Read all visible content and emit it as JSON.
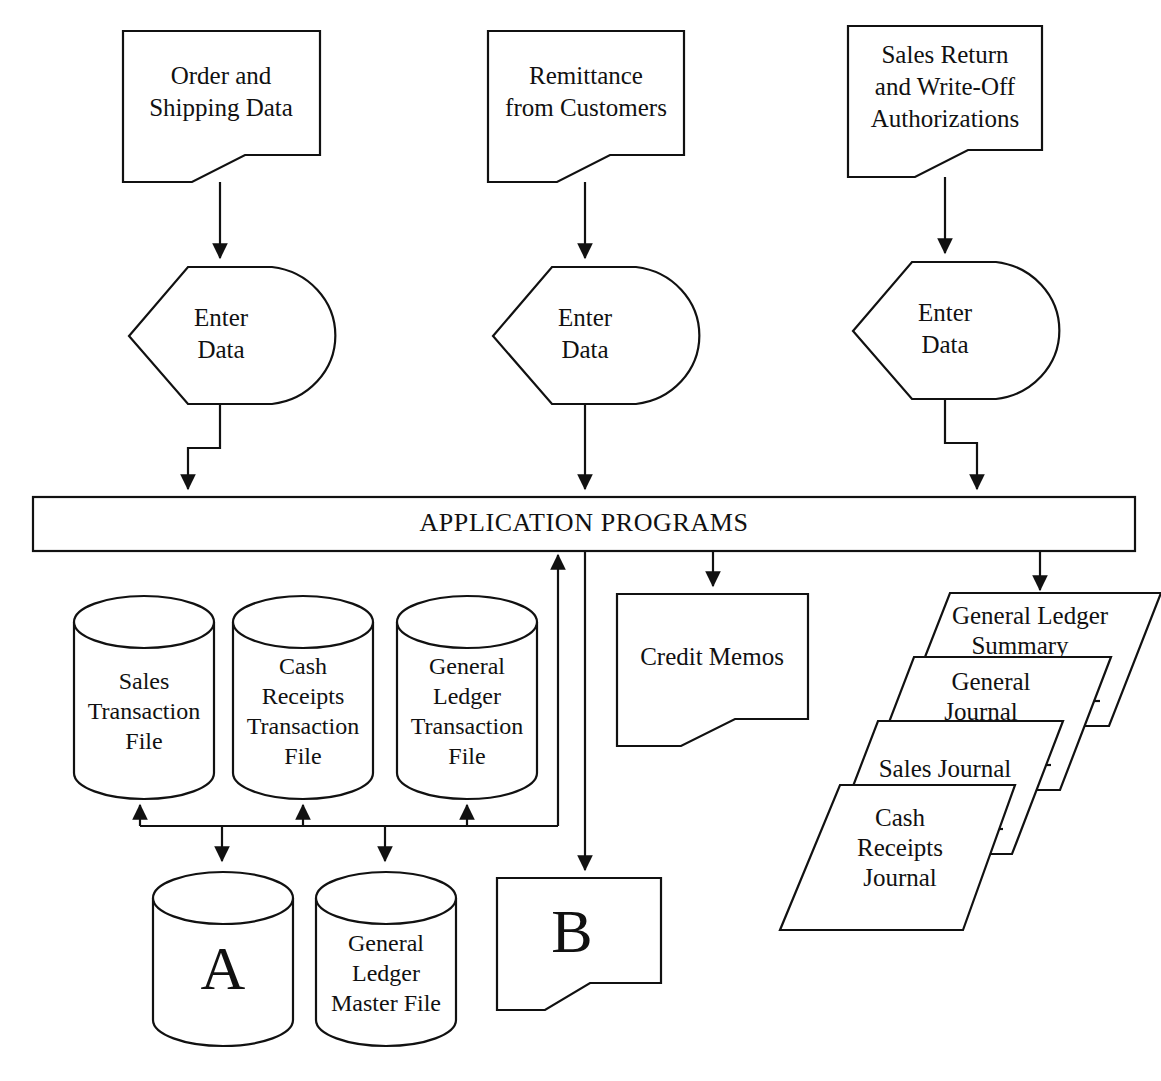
{
  "diagram": {
    "accent_color": "#111111",
    "background_color": "#ffffff"
  },
  "inputs": [
    {
      "id": "order-shipping-data",
      "line1": "Order and",
      "line2": "Shipping Data",
      "line3": ""
    },
    {
      "id": "remittance-customers",
      "line1": "Remittance",
      "line2": "from Customers",
      "line3": ""
    },
    {
      "id": "sales-return-writeoff",
      "line1": "Sales Return",
      "line2": "and Write-Off",
      "line3": "Authorizations"
    }
  ],
  "processes": [
    {
      "id": "enter-data-1",
      "line1": "Enter",
      "line2": "Data"
    },
    {
      "id": "enter-data-2",
      "line1": "Enter",
      "line2": "Data"
    },
    {
      "id": "enter-data-3",
      "line1": "Enter",
      "line2": "Data"
    }
  ],
  "application_bar": {
    "label": "APPLICATION PROGRAMS"
  },
  "transaction_files": [
    {
      "id": "sales-transaction-file",
      "line1": "Sales",
      "line2": "Transaction",
      "line3": "File",
      "line4": ""
    },
    {
      "id": "cash-receipts-transaction-file",
      "line1": "Cash",
      "line2": "Receipts",
      "line3": "Transaction",
      "line4": "File"
    },
    {
      "id": "general-ledger-transaction-file",
      "line1": "General",
      "line2": "Ledger",
      "line3": "Transaction",
      "line4": "File"
    }
  ],
  "master_files": [
    {
      "id": "connector-a",
      "line1": "A",
      "line2": "",
      "line3": "",
      "big": true
    },
    {
      "id": "general-ledger-master-file",
      "line1": "General",
      "line2": "Ledger",
      "line3": "Master File",
      "big": false
    }
  ],
  "output_documents": [
    {
      "id": "credit-memos",
      "label": "Credit Memos",
      "big": false
    },
    {
      "id": "connector-b",
      "label": "B",
      "big": true
    }
  ],
  "journals": [
    {
      "id": "general-ledger-summary",
      "line1": "General Ledger",
      "line2": "Summary",
      "line3": ""
    },
    {
      "id": "general-journal",
      "line1": "General",
      "line2": "Journal",
      "line3": ""
    },
    {
      "id": "sales-journal",
      "line1": "Sales Journal",
      "line2": "",
      "line3": ""
    },
    {
      "id": "cash-receipts-journal",
      "line1": "Cash",
      "line2": "Receipts",
      "line3": "Journal"
    }
  ]
}
